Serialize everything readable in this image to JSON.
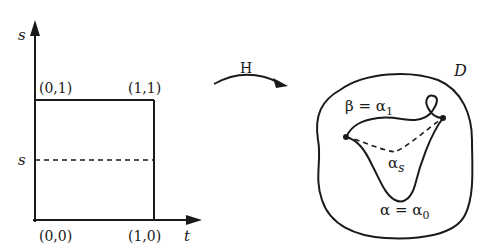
{
  "left_panel": {
    "y_axis_label": "s",
    "x_axis_label": "t",
    "corner_top_left": "(0,1)",
    "corner_top_right": "(1,1)",
    "corner_bottom_left": "(0,0)",
    "corner_bottom_right": "(1,0)",
    "dashed_line_label": "s"
  },
  "mapping": {
    "label": "H"
  },
  "right_panel": {
    "region_label": "D",
    "beta_label": "β = α",
    "beta_sub": "1",
    "alpha_s_label": "α",
    "alpha_s_sub": "s",
    "alpha_label": "α = α",
    "alpha_sub": "0"
  },
  "colors": {
    "stroke": "#1a1a1a",
    "background": "#ffffff"
  }
}
